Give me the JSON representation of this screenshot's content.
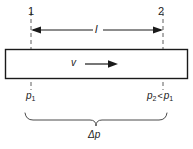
{
  "figure": {
    "type": "pipe-pressure-drop-diagram",
    "background_color": "#ffffff",
    "line_color": "#1a1a1a",
    "dashed_color": "#5a5a5a",
    "width": 193,
    "height": 149
  },
  "stations": {
    "left_label": "1",
    "right_label": "2"
  },
  "length_dimension": {
    "label": "l",
    "arrow_left": "arrow-left",
    "arrow_right": "arrow-right"
  },
  "flow": {
    "velocity_label": "v",
    "arrow": "arrow-right"
  },
  "pressures": {
    "inlet": {
      "symbol": "p",
      "subscript": "1"
    },
    "outlet": {
      "symbol": "p",
      "subscript": "2",
      "relation": "<",
      "compared_symbol": "p",
      "compared_subscript": "1"
    }
  },
  "pressure_drop": {
    "label": "Δp",
    "brace": "curly-brace-down"
  }
}
